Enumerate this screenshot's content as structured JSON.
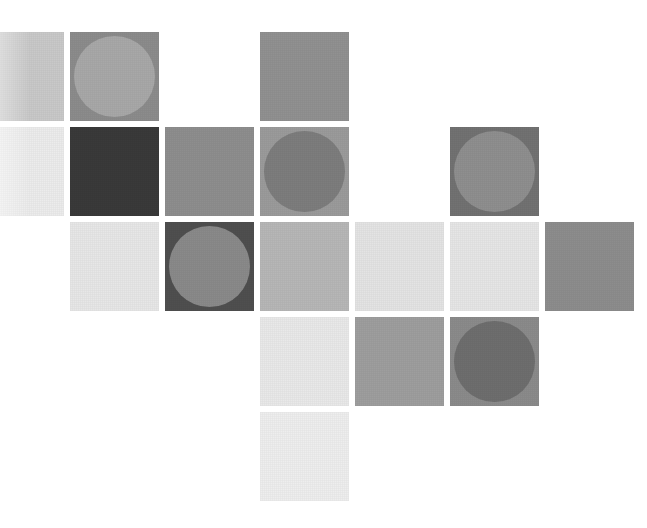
{
  "artwork": {
    "title": "Grayscale Tile Mosaic",
    "description": "Abstract grid of grayscale squares, several containing inscribed circles of a contrasting gray",
    "canvas": {
      "width": 647,
      "height": 528,
      "background": "#ffffff"
    },
    "grid": {
      "columns": 6,
      "rows": 5,
      "tile_size": 89,
      "gap": 6,
      "origin_x": -25,
      "origin_y": 32
    },
    "palette": {
      "near_white": "#f2f2f2",
      "very_light": "#e9e9e9",
      "light": "#dedede",
      "light_mid": "#c9c9c9",
      "mid": "#b4b4b4",
      "mid_gray": "#9a9a9a",
      "gray": "#8c8c8c",
      "dark_gray": "#7a7a7a",
      "darker": "#6b6b6b",
      "charcoal": "#4a4a4a",
      "near_black": "#3a3a3a"
    },
    "tiles": [
      {
        "id": "tile-r1c1",
        "row": 1,
        "col": 1,
        "fill": "#c9c9c9",
        "circle": null,
        "clipped": true
      },
      {
        "id": "tile-r1c2",
        "row": 1,
        "col": 2,
        "fill": "#8c8c8c",
        "circle": "#a8a8a8",
        "clipped": false
      },
      {
        "id": "tile-r1c4",
        "row": 1,
        "col": 4,
        "fill": "#919191",
        "circle": null,
        "clipped": false
      },
      {
        "id": "tile-r2c1",
        "row": 2,
        "col": 1,
        "fill": "#ececec",
        "circle": null,
        "clipped": true
      },
      {
        "id": "tile-r2c2",
        "row": 2,
        "col": 2,
        "fill": "#3a3a3a",
        "circle": null,
        "clipped": false
      },
      {
        "id": "tile-r2c3",
        "row": 2,
        "col": 3,
        "fill": "#8e8e8e",
        "circle": null,
        "clipped": false
      },
      {
        "id": "tile-r2c4",
        "row": 2,
        "col": 4,
        "fill": "#9b9b9b",
        "circle": "#7d7d7d",
        "clipped": false
      },
      {
        "id": "tile-r2c6",
        "row": 2,
        "col": 6,
        "fill": "#727272",
        "circle": "#8f8f8f",
        "clipped": false
      },
      {
        "id": "tile-r3c2",
        "row": 3,
        "col": 2,
        "fill": "#e7e7e7",
        "circle": null,
        "clipped": false
      },
      {
        "id": "tile-r3c3",
        "row": 3,
        "col": 3,
        "fill": "#4f4f4f",
        "circle": "#8a8a8a",
        "clipped": false
      },
      {
        "id": "tile-r3c4",
        "row": 3,
        "col": 4,
        "fill": "#b7b7b7",
        "circle": null,
        "clipped": false
      },
      {
        "id": "tile-r3c5",
        "row": 3,
        "col": 5,
        "fill": "#e4e4e4",
        "circle": null,
        "clipped": false
      },
      {
        "id": "tile-r3c6",
        "row": 3,
        "col": 6,
        "fill": "#e6e6e6",
        "circle": null,
        "clipped": false
      },
      {
        "id": "tile-r3c7",
        "row": 3,
        "col": 7,
        "fill": "#8d8d8d",
        "circle": null,
        "clipped": false
      },
      {
        "id": "tile-r4c4",
        "row": 4,
        "col": 4,
        "fill": "#e9e9e9",
        "circle": null,
        "clipped": false
      },
      {
        "id": "tile-r4c5",
        "row": 4,
        "col": 5,
        "fill": "#9e9e9e",
        "circle": null,
        "clipped": false
      },
      {
        "id": "tile-r4c6",
        "row": 4,
        "col": 6,
        "fill": "#8b8b8b",
        "circle": "#6e6e6e",
        "clipped": false
      },
      {
        "id": "tile-r5c4",
        "row": 5,
        "col": 4,
        "fill": "#eeeeee",
        "circle": null,
        "clipped": false
      }
    ]
  }
}
